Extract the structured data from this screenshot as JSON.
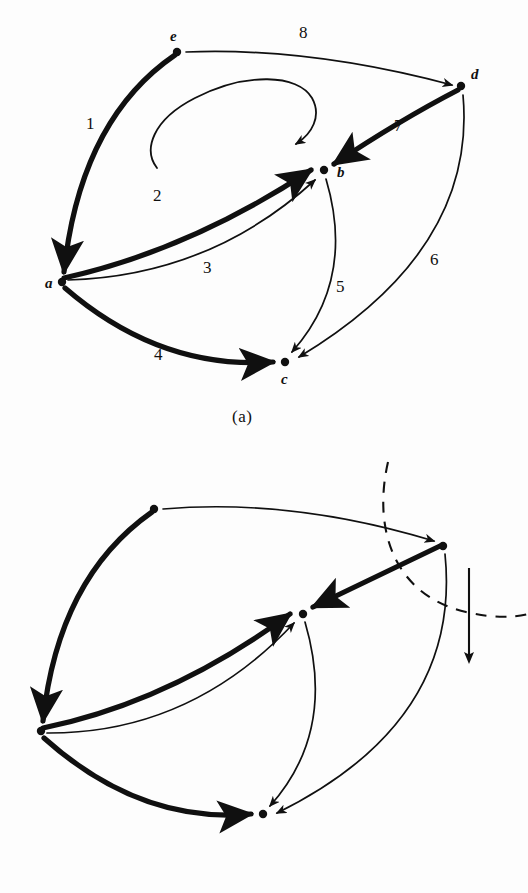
{
  "figure": {
    "background_color": "#fdfdfd",
    "ink_color": "#101010",
    "panels": [
      {
        "id": "a",
        "caption": "(a)",
        "caption_pos": {
          "x": 232,
          "y": 408
        },
        "nodes": [
          {
            "id": "a",
            "label": "a",
            "x": 62,
            "y": 282,
            "label_x": 45,
            "label_y": 283
          },
          {
            "id": "b",
            "label": "b",
            "x": 324,
            "y": 170,
            "label_x": 337,
            "label_y": 172
          },
          {
            "id": "c",
            "label": "c",
            "x": 285,
            "y": 362,
            "label_x": 281,
            "label_y": 379
          },
          {
            "id": "d",
            "label": "d",
            "x": 461,
            "y": 86,
            "label_x": 471,
            "label_y": 74
          },
          {
            "id": "e",
            "label": "e",
            "x": 177,
            "y": 52,
            "label_x": 170,
            "label_y": 36
          }
        ],
        "edges": [
          {
            "number": "1",
            "from": "e",
            "to": "a",
            "weight": "heavy",
            "label_x": 86,
            "label_y": 124
          },
          {
            "number": "2",
            "from": "a",
            "to": "b",
            "weight": "heavy",
            "label_x": 153,
            "label_y": 196
          },
          {
            "number": "3",
            "from": "a",
            "to": "b",
            "weight": "light",
            "label_x": 203,
            "label_y": 268
          },
          {
            "number": "4",
            "from": "a",
            "to": "c",
            "weight": "heavy",
            "label_x": 154,
            "label_y": 355
          },
          {
            "number": "5",
            "from": "b",
            "to": "c",
            "weight": "light",
            "label_x": 336,
            "label_y": 287
          },
          {
            "number": "6",
            "from": "d",
            "to": "c",
            "weight": "light",
            "label_x": 430,
            "label_y": 260
          },
          {
            "number": "7",
            "from": "d",
            "to": "b",
            "weight": "heavy",
            "label_x": 394,
            "label_y": 126
          },
          {
            "number": "8",
            "from": "e",
            "to": "d",
            "weight": "light",
            "label_x": 299,
            "label_y": 33
          }
        ],
        "annotations": [
          {
            "kind": "rotation-loop-arrow",
            "description": "clockwise curved loop arrow indicating rotation direction"
          }
        ]
      },
      {
        "id": "b",
        "caption": "(b)",
        "caption_pos": {
          "x": 212,
          "y": 851
        },
        "nodes": [
          {
            "id": "a",
            "label": "a",
            "x": 41,
            "y": 731,
            "label_x": 24,
            "label_y": 732
          },
          {
            "id": "b",
            "label": "b",
            "x": 303,
            "y": 614,
            "label_x": 317,
            "label_y": 618
          },
          {
            "id": "c",
            "label": "c",
            "x": 263,
            "y": 814,
            "label_x": 259,
            "label_y": 831
          },
          {
            "id": "d",
            "label": "d",
            "x": 443,
            "y": 546,
            "label_x": 454,
            "label_y": 534
          },
          {
            "id": "e",
            "label": "e",
            "x": 154,
            "y": 509,
            "label_x": 147,
            "label_y": 493
          }
        ],
        "edges": [
          {
            "number": "1",
            "from": "e",
            "to": "a",
            "weight": "heavy",
            "label_x": 91,
            "label_y": 596
          },
          {
            "number": "2",
            "from": "a",
            "to": "b",
            "weight": "heavy",
            "label_x": 160,
            "label_y": 620
          },
          {
            "number": "3",
            "from": "a",
            "to": "b",
            "weight": "light",
            "label_x": 196,
            "label_y": 726
          },
          {
            "number": "4",
            "from": "a",
            "to": "c",
            "weight": "heavy",
            "label_x": 122,
            "label_y": 809
          },
          {
            "number": "5",
            "from": "b",
            "to": "c",
            "weight": "light",
            "label_x": 325,
            "label_y": 727
          },
          {
            "number": "6",
            "from": "d",
            "to": "c",
            "weight": "light",
            "label_x": 393,
            "label_y": 746
          },
          {
            "number": "7",
            "from": "d",
            "to": "b",
            "weight": "heavy",
            "label_x": 357,
            "label_y": 600
          },
          {
            "number": "8",
            "from": "e",
            "to": "d",
            "weight": "light",
            "label_x": 303,
            "label_y": 481
          }
        ],
        "annotations": [
          {
            "kind": "dashed-arc",
            "description": "dashed quarter-circle arc sweeping around node d"
          },
          {
            "kind": "down-arrow",
            "description": "vertical solid arrow pointing downward"
          }
        ]
      }
    ]
  }
}
